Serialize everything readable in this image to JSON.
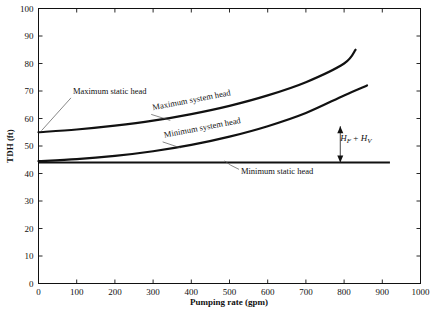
{
  "chart_data": {
    "type": "line",
    "title": "",
    "xlabel": "Pumping rate (gpm)",
    "ylabel": "TDH (ft)",
    "xlim": [
      0,
      1000
    ],
    "ylim": [
      0,
      100
    ],
    "xticks": [
      0,
      100,
      200,
      300,
      400,
      500,
      600,
      700,
      800,
      900,
      1000
    ],
    "yticks": [
      0,
      10,
      20,
      30,
      40,
      50,
      60,
      70,
      80,
      90,
      100
    ],
    "grid": false,
    "legend": "none",
    "series": [
      {
        "name": "Maximum system head",
        "x": [
          0,
          100,
          200,
          300,
          400,
          500,
          600,
          700,
          800,
          830
        ],
        "values": [
          55.0,
          56.0,
          57.4,
          59.2,
          61.6,
          64.6,
          68.4,
          73.2,
          80.0,
          85.0
        ]
      },
      {
        "name": "Minimum system head",
        "x": [
          0,
          100,
          200,
          300,
          400,
          500,
          600,
          700,
          800,
          860
        ],
        "values": [
          44.5,
          45.2,
          46.4,
          48.1,
          50.4,
          53.4,
          57.2,
          62.0,
          68.4,
          72.0
        ]
      },
      {
        "name": "Minimum static head",
        "x": [
          0,
          920
        ],
        "values": [
          44.0,
          44.0
        ]
      }
    ],
    "annotations": [
      {
        "name": "maximum-static-head",
        "text": "Maximum static head",
        "x_data": 90,
        "y_data": 69
      },
      {
        "name": "maximum-system-head",
        "text": "Maximum system head",
        "x_data": 300,
        "y_data": 63
      },
      {
        "name": "minimum-system-head",
        "text": "Minimum system head",
        "x_data": 330,
        "y_data": 53
      },
      {
        "name": "minimum-static-head",
        "text": "Minimum static head",
        "x_data": 530,
        "y_data": 40
      },
      {
        "name": "friction-velocity-head",
        "text": "HF + HV",
        "x_data": 790,
        "y_data": 52
      }
    ]
  },
  "math_labels": {
    "h": "H",
    "sub_f": "F",
    "plus": "+",
    "sub_v": "V"
  }
}
